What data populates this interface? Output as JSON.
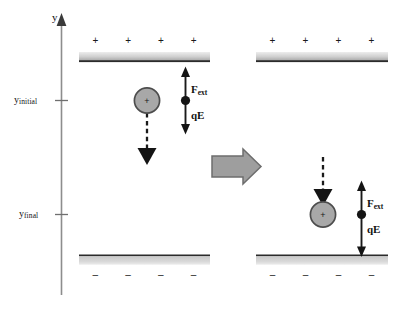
{
  "figure": {
    "title": "",
    "axis": {
      "name": "y",
      "ticks": [
        {
          "id": "y-initial",
          "base": "y",
          "sub": "initial"
        },
        {
          "id": "y-final",
          "base": "y",
          "sub": "final"
        }
      ]
    },
    "plate_signs": {
      "positive": "+",
      "negative": "–",
      "count": 4
    },
    "charge": {
      "sign": "+",
      "fill": "#a8a8a8",
      "stroke": "#4d4d4d"
    },
    "plate": {
      "fill_light": "#e2e2e2",
      "fill_dark": "#9a9a9a",
      "edge": "#2b2b2b"
    },
    "colors": {
      "ink": "#111111",
      "axis": "#8a8a8a",
      "transition_arrow_fill": "#9e9e9e",
      "transition_arrow_stroke": "#6d6d6d",
      "dashed_arrow": "#1a1a1a"
    },
    "panels": [
      {
        "id": "before",
        "force_up_label": {
          "base": "F",
          "sub": "ext"
        },
        "force_down_label": {
          "base": "qE",
          "sub": ""
        }
      },
      {
        "id": "after",
        "force_up_label": {
          "base": "F",
          "sub": "ext"
        },
        "force_down_label": {
          "base": "qE",
          "sub": ""
        }
      }
    ]
  }
}
